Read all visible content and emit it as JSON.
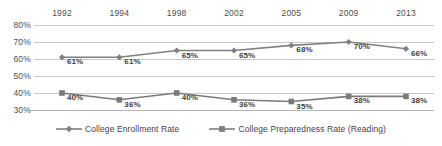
{
  "chart_data": {
    "type": "line",
    "title": "",
    "subtitle": "",
    "xlabel": "",
    "ylabel": "",
    "categories": [
      "1992",
      "1994",
      "1998",
      "2002",
      "2005",
      "2009",
      "2013"
    ],
    "ylim": [
      30,
      80
    ],
    "ytick_labels": [
      "80%",
      "70%",
      "60%",
      "50%",
      "40%",
      "30%"
    ],
    "yticks": [
      80,
      70,
      60,
      50,
      40,
      30
    ],
    "grid": true,
    "legend_position": "bottom",
    "series": [
      {
        "name": "College Enrollment Rate",
        "marker": "diamond",
        "color": "#808080",
        "values": [
          61,
          61,
          65,
          65,
          68,
          70,
          66
        ],
        "labels": [
          "61%",
          "61%",
          "65%",
          "65%",
          "68%",
          "70%",
          "66%"
        ]
      },
      {
        "name": "College Preparedness Rate (Reading)",
        "marker": "square",
        "color": "#7a7a7a",
        "values": [
          40,
          36,
          40,
          36,
          35,
          38,
          38
        ],
        "labels": [
          "40%",
          "36%",
          "40%",
          "36%",
          "35%",
          "38%",
          "38%"
        ]
      }
    ]
  },
  "legend": {
    "items": [
      {
        "label": "College Enrollment Rate",
        "marker": "diamond-marker-icon"
      },
      {
        "label": "College Preparedness Rate (Reading)",
        "marker": "square-marker-icon"
      }
    ]
  },
  "colors": {
    "line": "#808080",
    "grid": "#c9c9c9",
    "axis": "#b5b5b5",
    "text": "#4d4d4d",
    "label_text": "#3f3f3f"
  }
}
